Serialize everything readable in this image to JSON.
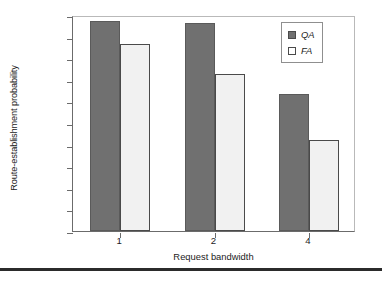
{
  "chart_data": {
    "type": "bar",
    "title": "",
    "xlabel": "Request bandwidth",
    "ylabel": "Route-establishment probability",
    "categories": [
      "1",
      "2",
      "4"
    ],
    "series": [
      {
        "name": "QA",
        "values": [
          97,
          96.5,
          63.5
        ],
        "color": "#707070"
      },
      {
        "name": "FA",
        "values": [
          86.5,
          72.5,
          42
        ],
        "color": "#f1f1f1"
      }
    ],
    "ylim": [
      0,
      100
    ],
    "yticks": [
      "0%",
      "10%",
      "20%",
      "30%",
      "40%",
      "50%",
      "60%",
      "70%",
      "80%",
      "90%",
      "100%"
    ],
    "ytick_values": [
      0,
      10,
      20,
      30,
      40,
      50,
      60,
      70,
      80,
      90,
      100
    ],
    "grid": false,
    "legend_position": "top-right",
    "legend_entries": [
      "QA",
      "FA"
    ]
  },
  "axes": {
    "y_title": "Route-establishment probability",
    "x_title": "Request bandwidth"
  },
  "legend": {
    "items": [
      {
        "label": "QA",
        "swatch": "filled-gray-swatch"
      },
      {
        "label": "FA",
        "swatch": "outlined-white-swatch"
      }
    ]
  }
}
